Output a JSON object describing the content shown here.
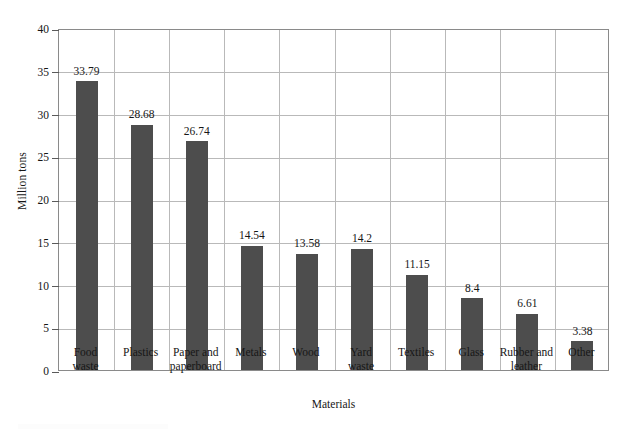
{
  "chart_data": {
    "type": "bar",
    "title": "",
    "xlabel": "Materials",
    "ylabel": "Million tons",
    "categories": [
      "Food waste",
      "Plastics",
      "Paper and paperboard",
      "Metals",
      "Wood",
      "Yard waste",
      "Textiles",
      "Glass",
      "Rubber and leather",
      "Other"
    ],
    "category_lines": [
      [
        "Food",
        "waste"
      ],
      [
        "Plastics"
      ],
      [
        "Paper and",
        "paperboard"
      ],
      [
        "Metals"
      ],
      [
        "Wood"
      ],
      [
        "Yard",
        "waste"
      ],
      [
        "Textiles"
      ],
      [
        "Glass"
      ],
      [
        "Rubber and",
        "leather"
      ],
      [
        "Other"
      ]
    ],
    "values": [
      33.79,
      28.68,
      26.74,
      14.54,
      13.58,
      14.2,
      11.15,
      8.4,
      6.61,
      3.38
    ],
    "value_labels": [
      "33.79",
      "28.68",
      "26.74",
      "14.54",
      "13.58",
      "14.2",
      "11.15",
      "8.4",
      "6.61",
      "3.38"
    ],
    "ylim": [
      0,
      40
    ],
    "ytick_values": [
      0,
      5,
      10,
      15,
      20,
      25,
      30,
      35,
      40
    ],
    "ytick_labels": [
      "0",
      "5",
      "10",
      "15",
      "20",
      "25",
      "30",
      "35",
      "40"
    ],
    "grid": "both",
    "legend": "none",
    "bar_color": "#4d4d4d",
    "grid_color": "#b9b9b9",
    "axis_color": "#8a8a8a",
    "background_color": "#ffffff"
  }
}
